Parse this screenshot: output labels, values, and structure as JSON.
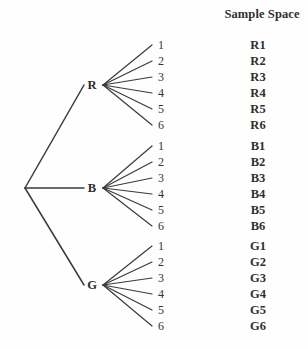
{
  "diagram": {
    "type": "probability-tree",
    "title": "Sample Space",
    "background_color": "#fefefe",
    "line_color": "#3b3b3b",
    "text_color": "#2e2e2e",
    "root": {
      "x": 25,
      "y": 188
    },
    "stage1": {
      "label_x": 92,
      "fan_x": 103,
      "nodes": [
        {
          "label": "R",
          "name": "red",
          "y": 85
        },
        {
          "label": "B",
          "name": "blue",
          "y": 188
        },
        {
          "label": "G",
          "name": "green",
          "y": 285
        }
      ]
    },
    "stage2": {
      "leaf_line_end_x": 152,
      "leaf_label_x": 158,
      "outcome_label_x": 258,
      "row_spacing": 16,
      "groups": [
        {
          "node": "R",
          "first_row_y": 45,
          "leaves": [
            "1",
            "2",
            "3",
            "4",
            "5",
            "6"
          ],
          "outcomes": [
            "R1",
            "R2",
            "R3",
            "R4",
            "R5",
            "R6"
          ]
        },
        {
          "node": "B",
          "first_row_y": 146,
          "leaves": [
            "1",
            "2",
            "3",
            "4",
            "5",
            "6"
          ],
          "outcomes": [
            "B1",
            "B2",
            "B3",
            "B4",
            "B5",
            "B6"
          ]
        },
        {
          "node": "G",
          "first_row_y": 246,
          "leaves": [
            "1",
            "2",
            "3",
            "4",
            "5",
            "6"
          ],
          "outcomes": [
            "G1",
            "G2",
            "G3",
            "G4",
            "G5",
            "G6"
          ]
        }
      ]
    },
    "title_position": {
      "x": 262,
      "y": 14
    }
  }
}
